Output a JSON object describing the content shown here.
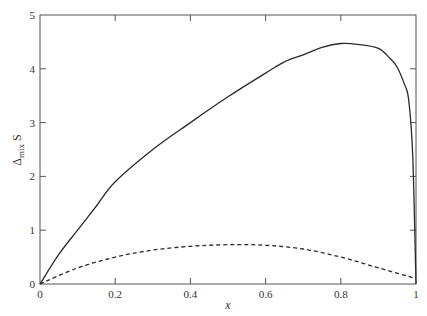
{
  "chart_data": {
    "type": "line",
    "title": "",
    "xlabel": "x",
    "ylabel": "Δmix S",
    "ylabel_parts": {
      "delta": "Δ",
      "sub": "mix",
      "main": "S"
    },
    "xlim": [
      0,
      1
    ],
    "ylim": [
      0,
      5
    ],
    "xticks": [
      0,
      0.2,
      0.4,
      0.6,
      0.8,
      1
    ],
    "xtick_labels": [
      "0",
      "0.2",
      "0.4",
      "0.6",
      "0.8",
      "1"
    ],
    "yticks": [
      0,
      1,
      2,
      3,
      4,
      5
    ],
    "ytick_labels": [
      "0",
      "1",
      "2",
      "3",
      "4",
      "5"
    ],
    "grid": false,
    "legend": null,
    "series": [
      {
        "name": "solid",
        "style": "solid",
        "color": "#2a2a2a",
        "x": [
          0,
          0.05,
          0.1,
          0.15,
          0.2,
          0.3,
          0.4,
          0.5,
          0.6,
          0.65,
          0.7,
          0.75,
          0.8,
          0.85,
          0.9,
          0.93,
          0.95,
          0.97,
          0.98,
          0.99,
          0.995,
          1.0
        ],
        "y": [
          0,
          0.55,
          1.0,
          1.45,
          1.9,
          2.5,
          3.0,
          3.48,
          3.92,
          4.13,
          4.26,
          4.4,
          4.47,
          4.45,
          4.38,
          4.2,
          4.03,
          3.7,
          3.45,
          2.6,
          1.5,
          0
        ]
      },
      {
        "name": "dashed",
        "style": "dashed",
        "color": "#2a2a2a",
        "x": [
          0,
          0.1,
          0.2,
          0.3,
          0.4,
          0.5,
          0.6,
          0.7,
          0.8,
          0.9,
          1.0
        ],
        "y": [
          0,
          0.3,
          0.5,
          0.63,
          0.7,
          0.73,
          0.72,
          0.65,
          0.5,
          0.3,
          0.1
        ]
      }
    ]
  }
}
